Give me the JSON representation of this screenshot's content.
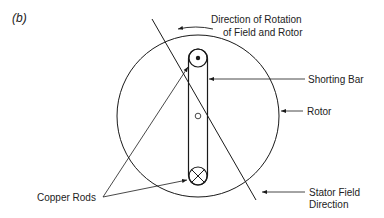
{
  "panel_label": "(b)",
  "labels": {
    "rotation_line1": "Direction of Rotation",
    "rotation_line2": "of Field and Rotor",
    "shorting_bar": "Shorting Bar",
    "rotor": "Rotor",
    "copper_rods": "Copper Rods",
    "stator_line1": "Stator Field",
    "stator_line2": "Direction"
  },
  "symbols": {
    "top_rod": "current-out-dot",
    "bottom_rod": "current-in-cross",
    "axle": "center-pivot"
  },
  "colors": {
    "line": "#1a1a1a",
    "text": "#222222",
    "background": "#ffffff"
  }
}
